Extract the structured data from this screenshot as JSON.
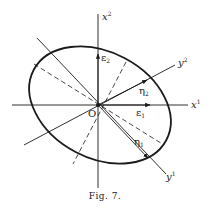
{
  "figure": {
    "caption": "Fig. 7.",
    "origin_label": "O",
    "axes": {
      "x1": {
        "base": "x",
        "sup": "1"
      },
      "x2": {
        "base": "x",
        "sup": "2"
      },
      "y1": {
        "base": "y",
        "sup": "1"
      },
      "y2": {
        "base": "y",
        "sup": "2"
      }
    },
    "vectors": {
      "xi1": {
        "base": "ε",
        "sub": "1"
      },
      "xi2": {
        "base": "ε",
        "sub": "2"
      },
      "eta1": {
        "base": "η",
        "sub": "1"
      },
      "eta2": {
        "base": "η",
        "sub": "2"
      }
    },
    "colors": {
      "ink": "#1a1a1a",
      "paper": "#ffffff"
    }
  }
}
